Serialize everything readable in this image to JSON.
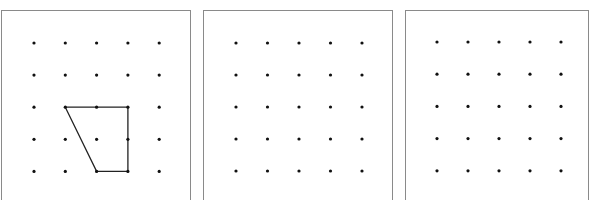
{
  "figure": {
    "background": "#ffffff",
    "border_color": "#8a8a8a",
    "dot_color": "#111111",
    "line_color": "#222222",
    "panels": [
      {
        "id": "panel-1",
        "left": 1,
        "width": 190,
        "dot_grid": {
          "cols": 5,
          "rows": 5,
          "x0": 32,
          "y0": 32,
          "dx": 31.3,
          "dy": 32.1
        },
        "shape": {
          "type": "quadrilateral",
          "vertices_grid": [
            [
              1,
              2
            ],
            [
              3,
              2
            ],
            [
              3,
              4
            ],
            [
              2,
              4
            ]
          ]
        }
      },
      {
        "id": "panel-2",
        "left": 203,
        "width": 190,
        "dot_grid": {
          "cols": 5,
          "rows": 5,
          "x0": 32,
          "y0": 32,
          "dx": 31.5,
          "dy": 32.0
        },
        "shape": null
      },
      {
        "id": "panel-3",
        "left": 405,
        "width": 184,
        "dot_grid": {
          "cols": 5,
          "rows": 5,
          "x0": 31,
          "y0": 31,
          "dx": 31.0,
          "dy": 32.2
        },
        "shape": null
      }
    ]
  }
}
